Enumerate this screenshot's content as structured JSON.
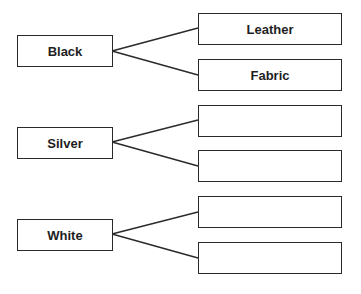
{
  "diagram": {
    "type": "tree",
    "groups": [
      {
        "label": "Black",
        "children": [
          "Leather",
          "Fabric"
        ]
      },
      {
        "label": "Silver",
        "children": [
          "",
          ""
        ]
      },
      {
        "label": "White",
        "children": [
          "",
          ""
        ]
      }
    ]
  },
  "colors": {
    "line": "#2a2a2a",
    "text": "#1e1e1e",
    "background": "#ffffff"
  }
}
